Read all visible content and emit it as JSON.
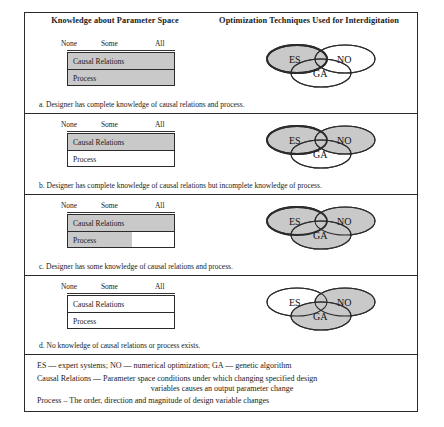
{
  "figure": {
    "headers": {
      "left": "Knowledge about Parameter Space",
      "right": "Optimization Techniques Used for Interdigitation"
    },
    "scale_labels": {
      "none": "None",
      "some": "Some",
      "all": "All"
    },
    "bar_labels": {
      "causal": "Causal Relations",
      "process": "Process"
    },
    "venn_labels": {
      "es": "ES",
      "no": "NO",
      "ga": "GA"
    },
    "cases": [
      {
        "id": "a",
        "caption": "a. Designer has complete knowledge of causal relations and process.",
        "causal_fill_percent": 100,
        "process_fill_percent": 100,
        "venn_shaded": [
          "ES"
        ]
      },
      {
        "id": "b",
        "caption": "b. Designer has complete knowledge of causal relations but incomplete knowledge of process.",
        "causal_fill_percent": 100,
        "process_fill_percent": 0,
        "venn_shaded": [
          "ES",
          "NO"
        ]
      },
      {
        "id": "c",
        "caption": "c. Designer has some knowledge of causal relations and process.",
        "causal_fill_percent": 100,
        "process_fill_percent": 60,
        "venn_shaded": [
          "ES",
          "NO",
          "GA"
        ]
      },
      {
        "id": "d",
        "caption": "d. No knowledge of causal relations or process exists.",
        "causal_fill_percent": 0,
        "process_fill_percent": 0,
        "venn_shaded": [
          "NO",
          "GA"
        ]
      }
    ],
    "legend": {
      "line1": "ES  —  expert systems; NO  —  numerical optimization; GA  —  genetic algorithm",
      "line2a": "Causal Relations  —  Parameter space conditions under which changing specified design",
      "line2b": "variables causes an output parameter change",
      "line3": "Process – The order, direction and magnitude of design variable changes"
    },
    "colors": {
      "shade": "#c9c9c9",
      "outline": "#2b2b2b",
      "background": "#ffffff"
    }
  }
}
